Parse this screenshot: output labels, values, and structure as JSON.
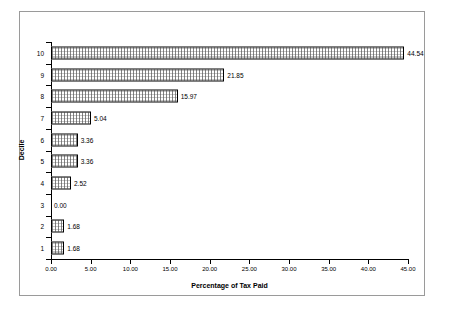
{
  "chart_data": {
    "type": "bar",
    "orientation": "horizontal",
    "title": "",
    "xlabel": "Percentage of Tax Paid",
    "ylabel": "Decile",
    "categories": [
      "1",
      "2",
      "3",
      "4",
      "5",
      "6",
      "7",
      "8",
      "9",
      "10"
    ],
    "values": [
      1.68,
      1.68,
      0.0,
      2.52,
      3.36,
      3.36,
      5.04,
      15.97,
      21.85,
      44.54
    ],
    "data_labels": [
      "1.68",
      "1.68",
      "0.00",
      "2.52",
      "3.36",
      "3.36",
      "5.04",
      "15.97",
      "21.85",
      "44.54"
    ],
    "xlim": [
      0,
      45
    ],
    "ylim": [
      0.5,
      10.5
    ],
    "xticks": [
      0,
      5,
      10,
      15,
      20,
      25,
      30,
      35,
      40,
      45
    ],
    "xtick_labels": [
      "0.00",
      "5.00",
      "10.00",
      "15.00",
      "20.00",
      "25.00",
      "30.00",
      "35.00",
      "40.00",
      "45.00"
    ],
    "ytick_labels": [
      "1",
      "2",
      "3",
      "4",
      "5",
      "6",
      "7",
      "8",
      "9",
      "10"
    ],
    "grid": false,
    "legend": null,
    "legend_position": "none",
    "bar_fill": "#ffffff",
    "bar_edge_color": "#000000",
    "bar_pattern": "fine-dotted-grid",
    "axis_color": "#000000",
    "frame_color": "#9a9a9a",
    "background": "#ffffff"
  }
}
